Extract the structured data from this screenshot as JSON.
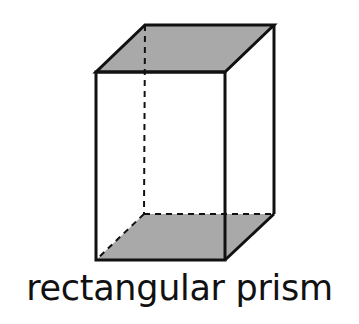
{
  "diagram": {
    "shape": "rectangular prism",
    "label": "rectangular prism",
    "face_fill": "#a9a9a9",
    "edge_color": "#111111"
  }
}
